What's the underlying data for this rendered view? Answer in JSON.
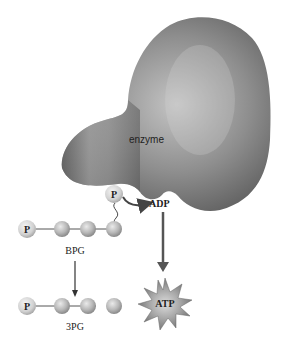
{
  "diagram": {
    "enzyme_label": "enzyme",
    "phosphate_label": "P",
    "adp_label": "ADP",
    "atp_label": "ATP",
    "bpg_label": "BPG",
    "pg3_label": "3PG",
    "colors": {
      "enzyme_dark": "#5a5a5a",
      "enzyme_light": "#b8b8b8",
      "sphere_light": "#e4e4e4",
      "sphere_dark": "#9a9a9a",
      "arrow": "#444444",
      "star_outer": "#7a7a7a",
      "star_inner": "#c8c8c8"
    }
  }
}
